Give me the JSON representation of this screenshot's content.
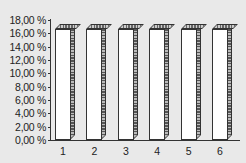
{
  "chart_data": {
    "type": "bar",
    "title": "",
    "xlabel": "",
    "ylabel": "",
    "categories": [
      "1",
      "2",
      "3",
      "4",
      "5",
      "6"
    ],
    "values": [
      16.67,
      16.67,
      16.67,
      16.67,
      16.67,
      16.67
    ],
    "value_format": "percent",
    "ylim": [
      0,
      18
    ],
    "yticks": [
      "0,00 %",
      "2,00 %",
      "4,00 %",
      "6,00 %",
      "8,00 %",
      "10,00 %",
      "12,00 %",
      "14,00 %",
      "16,00 %",
      "18,00 %"
    ],
    "grid": false,
    "legend": "none",
    "style": "3d-column"
  }
}
